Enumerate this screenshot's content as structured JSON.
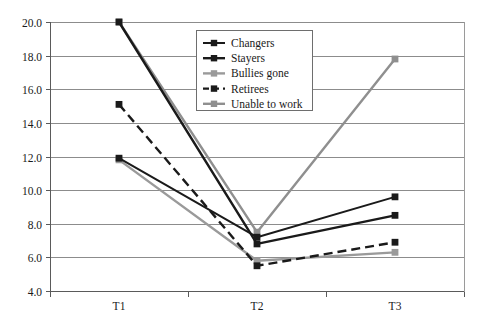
{
  "chart_data": {
    "type": "line",
    "title": "",
    "subtitle": "",
    "xlabel": "",
    "ylabel": "",
    "categories": [
      "T1",
      "T2",
      "T3"
    ],
    "xticks": [
      "T1",
      "T2",
      "T3"
    ],
    "yticks": [
      "4.0",
      "6.0",
      "8.0",
      "10.0",
      "12.0",
      "14.0",
      "16.0",
      "18.0",
      "20.0"
    ],
    "ylim": [
      4.0,
      20.0
    ],
    "ytick_step": 2.0,
    "grid": "horizontal",
    "legend_position": "top-center",
    "marker": "square",
    "series": [
      {
        "name": "Changers",
        "values": [
          11.9,
          7.2,
          9.6
        ],
        "color": "#1a1a1a",
        "dash": "solid",
        "width": 2.0
      },
      {
        "name": "Stayers",
        "values": [
          20.0,
          6.8,
          8.5
        ],
        "color": "#1a1a1a",
        "dash": "solid",
        "width": 2.4
      },
      {
        "name": "Bullies gone",
        "values": [
          11.8,
          5.8,
          6.3
        ],
        "color": "#9a9a9a",
        "dash": "solid",
        "width": 2.4
      },
      {
        "name": "Retirees",
        "values": [
          15.1,
          5.5,
          6.9
        ],
        "color": "#1a1a1a",
        "dash": "dashed",
        "width": 2.4
      },
      {
        "name": "Unable to work",
        "values": [
          20.0,
          7.5,
          17.8
        ],
        "color": "#8f8f8f",
        "dash": "solid",
        "width": 2.4
      }
    ]
  },
  "legend": {
    "entries": [
      {
        "label": "Changers"
      },
      {
        "label": "Stayers"
      },
      {
        "label": "Bullies gone"
      },
      {
        "label": "Retirees"
      },
      {
        "label": "Unable to work"
      }
    ]
  },
  "colors": {
    "grid": "#8c8c8c",
    "axis": "#5a5a5a",
    "text": "#1a1a1a",
    "background": "#ffffff",
    "dark_series": "#1a1a1a",
    "light_series": "#9a9a9a"
  }
}
